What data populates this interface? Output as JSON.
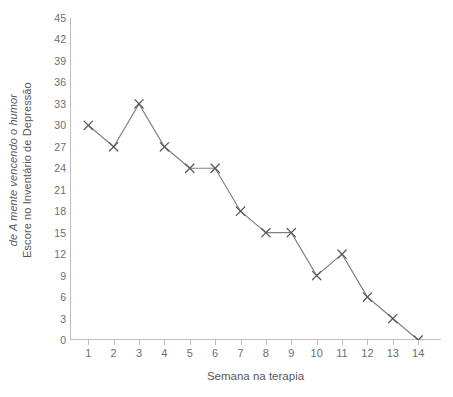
{
  "chart_data": {
    "type": "line",
    "title": "",
    "xlabel": "Semana na terapia",
    "ylabel_line1": "Escore no Inventário de Depressão",
    "ylabel_line2": "de A mente vencendo o humor",
    "x": [
      1,
      2,
      3,
      4,
      5,
      6,
      7,
      8,
      9,
      10,
      11,
      12,
      13,
      14
    ],
    "values": [
      30,
      27,
      33,
      27,
      24,
      24,
      18,
      15,
      15,
      9,
      12,
      6,
      3,
      0
    ],
    "categories": [
      "1",
      "2",
      "3",
      "4",
      "5",
      "6",
      "7",
      "8",
      "9",
      "10",
      "11",
      "12",
      "13",
      "14"
    ],
    "xtick_labels": [
      "1",
      "2",
      "3",
      "4",
      "5",
      "6",
      "7",
      "8",
      "9",
      "10",
      "11",
      "12",
      "13",
      "14"
    ],
    "ytick_labels": [
      "45",
      "42",
      "39",
      "36",
      "33",
      "30",
      "27",
      "24",
      "21",
      "18",
      "15",
      "12",
      "9",
      "6",
      "3",
      "0"
    ],
    "yticks": [
      45,
      42,
      39,
      36,
      33,
      30,
      27,
      24,
      21,
      18,
      15,
      12,
      9,
      6,
      3,
      0
    ],
    "ylim": [
      0,
      45
    ],
    "xlim": [
      1,
      14
    ],
    "grid": false,
    "legend": false,
    "marker": "x",
    "series": [
      {
        "name": "Escore do Inventário de Depressão",
        "values": [
          30,
          27,
          33,
          27,
          24,
          24,
          18,
          15,
          15,
          9,
          12,
          6,
          3,
          0
        ]
      }
    ],
    "colors": {
      "line": "#808285",
      "marker": "#58585a",
      "axis": "#bcbdc0",
      "text": "#58585a",
      "tick_text": "#6d6e71",
      "background": "#ffffff"
    }
  }
}
